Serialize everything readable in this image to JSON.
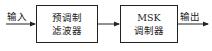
{
  "diagram": {
    "input_label": "输入",
    "output_label": "输出",
    "blocks": [
      {
        "line1": "预调制",
        "line2": "滤波器"
      },
      {
        "line1": "MSK",
        "line2": "调制器"
      }
    ],
    "line_color": "#222222"
  }
}
